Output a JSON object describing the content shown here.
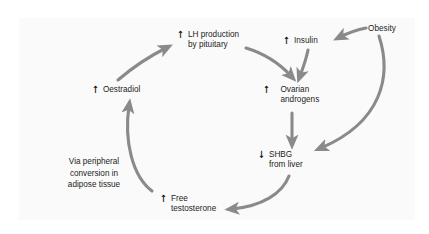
{
  "diagram": {
    "background_color": "#fafafa",
    "arrow_color": "#8a8a8a",
    "text_color": "#1d1d1d",
    "nodes": [
      {
        "id": "lh",
        "glyph": "↑",
        "label": "LH production\nby pituitary"
      },
      {
        "id": "insulin",
        "glyph": "↑",
        "label": "Insulin"
      },
      {
        "id": "obesity",
        "glyph": "",
        "label": "Obesity"
      },
      {
        "id": "oestradiol",
        "glyph": "↑",
        "label": "Oestradiol"
      },
      {
        "id": "ovarian",
        "glyph": "↑",
        "label": "Ovarian\nandrogens"
      },
      {
        "id": "shbg",
        "glyph": "↓",
        "label": "SHBG\nfrom liver"
      },
      {
        "id": "testosterone",
        "glyph": "↑",
        "label": "Free\ntestosterone"
      }
    ],
    "annotations": [
      {
        "id": "peripheral",
        "text": "Via peripheral\nconversion in\nadipose tissue"
      }
    ],
    "edges": [
      {
        "from": "oestradiol",
        "to": "lh"
      },
      {
        "from": "lh",
        "to": "ovarian"
      },
      {
        "from": "insulin",
        "to": "ovarian"
      },
      {
        "from": "obesity",
        "to": "insulin"
      },
      {
        "from": "obesity",
        "to": "shbg"
      },
      {
        "from": "ovarian",
        "to": "shbg"
      },
      {
        "from": "shbg",
        "to": "testosterone"
      },
      {
        "from": "testosterone",
        "to": "oestradiol"
      }
    ]
  }
}
